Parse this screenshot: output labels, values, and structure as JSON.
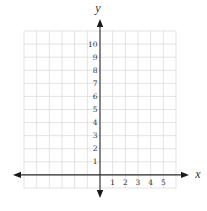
{
  "chart_data": {
    "type": "line",
    "title": "",
    "xlabel": "x",
    "ylabel": "y",
    "xlim": [
      -6,
      6
    ],
    "ylim": [
      -1,
      11
    ],
    "grid": true,
    "x_ticks": [
      1,
      2,
      3,
      4,
      5
    ],
    "y_ticks": [
      1,
      2,
      3,
      4,
      5,
      6,
      7,
      8,
      9,
      10
    ],
    "x_tick_labels": [
      "1",
      "2",
      "3",
      "4",
      "5"
    ],
    "y_tick_labels": [
      "1",
      "2",
      "3",
      "4",
      "5",
      "6",
      "7",
      "8",
      "9",
      "10"
    ],
    "series": [],
    "axes_arrows": true,
    "legend": null
  },
  "colors": {
    "grid": "#dcdcdc",
    "axis": "#2b2b2b",
    "label": "#333333"
  },
  "layout": {
    "grid_left": 24,
    "grid_right": 176,
    "grid_top": 31,
    "grid_bottom": 188,
    "origin_x": 100,
    "origin_y": 175,
    "x_arrow_left": 13,
    "x_arrow_right": 189,
    "y_arrow_top": 19,
    "y_arrow_bottom": 198
  }
}
